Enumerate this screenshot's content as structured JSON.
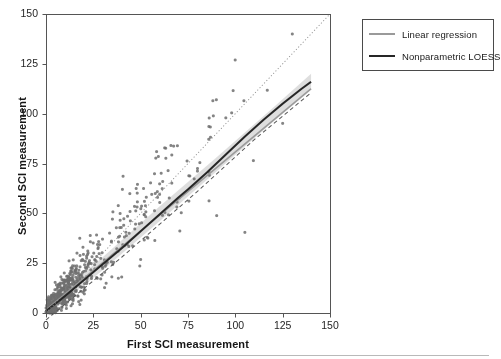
{
  "chart_data": {
    "type": "scatter",
    "title": "",
    "xlabel": "First SCI measurement",
    "ylabel": "Second SCI measurement",
    "xlim": [
      0,
      150
    ],
    "ylim": [
      0,
      150
    ],
    "xticks": [
      0,
      25,
      50,
      75,
      100,
      125,
      150
    ],
    "yticks": [
      0,
      25,
      50,
      75,
      100,
      125,
      150
    ],
    "grid": false,
    "legend_position": "outside-top-right",
    "marker": {
      "shape": "circle",
      "radius": 1.5,
      "color": "#6e6e6e",
      "opacity": 0.85
    },
    "frame_color": "#555555",
    "series": [
      {
        "name": "Linear regression",
        "type": "line",
        "color": "#9a9a9a",
        "width": 1.6,
        "dash": "solid",
        "points": [
          [
            0,
            1.5
          ],
          [
            140,
            112.5
          ]
        ]
      },
      {
        "name": "Nonparametric LOESS",
        "type": "line",
        "color": "#262626",
        "width": 2.0,
        "dash": "solid",
        "points": [
          [
            0,
            1.0
          ],
          [
            10,
            8.5
          ],
          [
            20,
            16.5
          ],
          [
            30,
            24.5
          ],
          [
            40,
            32.5
          ],
          [
            50,
            41.0
          ],
          [
            60,
            49.5
          ],
          [
            70,
            58.0
          ],
          [
            75,
            62.0
          ],
          [
            85,
            70.5
          ],
          [
            95,
            79.5
          ],
          [
            105,
            88.5
          ],
          [
            115,
            97.0
          ],
          [
            125,
            105.0
          ],
          [
            135,
            112.5
          ],
          [
            140,
            116.0
          ]
        ]
      },
      {
        "name": "Identity line",
        "type": "line",
        "color": "#8c8c8c",
        "width": 0.9,
        "dash": "dotted",
        "points": [
          [
            0,
            0
          ],
          [
            150,
            150
          ]
        ]
      },
      {
        "name": "LOESS lower band",
        "type": "line",
        "color": "#555555",
        "width": 1.0,
        "dash": "dashed",
        "points": [
          [
            0,
            -3.5
          ],
          [
            40,
            28.0
          ],
          [
            80,
            61.0
          ],
          [
            110,
            87.0
          ],
          [
            140,
            110.5
          ]
        ]
      }
    ],
    "confidence_band": {
      "name": "LOESS confidence band",
      "color": "#c2c2c2",
      "opacity": 0.55,
      "upper": [
        [
          0,
          4.0
        ],
        [
          30,
          28.0
        ],
        [
          60,
          53.5
        ],
        [
          90,
          78.0
        ],
        [
          120,
          103.0
        ],
        [
          140,
          120.0
        ]
      ],
      "lower": [
        [
          0,
          -1.5
        ],
        [
          30,
          21.5
        ],
        [
          60,
          46.0
        ],
        [
          90,
          71.0
        ],
        [
          120,
          96.0
        ],
        [
          140,
          112.0
        ]
      ]
    },
    "scatter_description": "Dense cluster of points along the diagonal near the origin, spreading out at higher values; roughly 620 observations between 0 and 140 on both axes.",
    "n_points": 620,
    "scatter_generation": {
      "seed": 20240917,
      "cluster_weight": 0.62,
      "cluster_scale": 11,
      "spread_scale": 46,
      "noise_base": 2.6,
      "noise_slope": 0.19,
      "max_value": 142
    }
  },
  "legend": {
    "items": [
      {
        "label": "Linear regression",
        "color": "#9a9a9a"
      },
      {
        "label": "Nonparametric LOESS",
        "color": "#262626"
      }
    ]
  },
  "axes": {
    "x_title": "First SCI measurement",
    "y_title": "Second SCI measurement",
    "x_tick_labels": [
      "0",
      "25",
      "50",
      "75",
      "100",
      "125",
      "150"
    ],
    "y_tick_labels": [
      "0",
      "25",
      "50",
      "75",
      "100",
      "125",
      "150"
    ]
  }
}
